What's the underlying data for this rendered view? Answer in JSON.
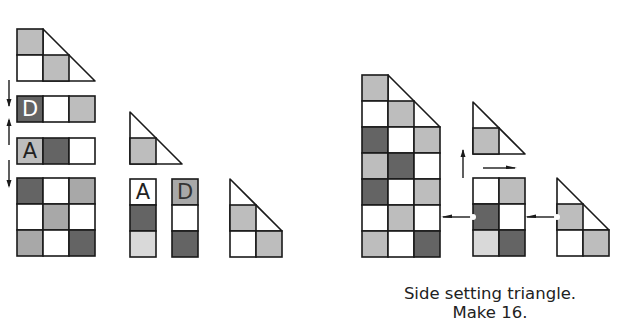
{
  "colors": {
    "W": "#ffffff",
    "L": "#bdbdbd",
    "X": "#d9d9d9",
    "M": "#a8a8a8",
    "D": "#646464",
    "stroke": "#1a1a1a"
  },
  "caption": {
    "line1": "Side setting triangle.",
    "line2": "Make 16."
  },
  "labels": {
    "A": "A",
    "D": "D"
  },
  "units": [
    {
      "name": "left-top-triangle-unit",
      "x": 17,
      "y": 29,
      "cell": 26,
      "rows": [
        "L",
        "WLW"
      ],
      "tri": [
        [
          0,
          1
        ],
        [
          0,
          2
        ]
      ],
      "triFill": "W"
    },
    {
      "name": "left-row-d",
      "x": 17,
      "y": 96,
      "cell": 26,
      "rows": [
        "DWL"
      ],
      "label": {
        "text": "D",
        "cell": 0,
        "color": "#ffffff"
      }
    },
    {
      "name": "left-row-a",
      "x": 17,
      "y": 138,
      "cell": 26,
      "rows": [
        "LDW"
      ],
      "label": {
        "text": "A",
        "cell": 0,
        "color": "#222222"
      }
    },
    {
      "name": "left-nine-patch",
      "x": 17,
      "y": 178,
      "cell": 26,
      "rows": [
        "DWM",
        "WMW",
        "MWD"
      ]
    },
    {
      "name": "mid-small-triangle",
      "x": 130,
      "y": 112,
      "cell": 26,
      "rows": [
        "",
        "L"
      ],
      "tri2": true
    },
    {
      "name": "mid-col-a",
      "x": 130,
      "y": 179,
      "cell": 26,
      "cols": [
        "W",
        "D",
        "X"
      ],
      "label": {
        "text": "A",
        "cell": 0,
        "color": "#222222"
      }
    },
    {
      "name": "mid-col-d",
      "x": 172,
      "y": 179,
      "cell": 26,
      "cols": [
        "M",
        "W",
        "D"
      ],
      "label": {
        "text": "D",
        "cell": 0,
        "color": "#333333"
      }
    },
    {
      "name": "mid-result-triangle",
      "x": 230,
      "y": 179,
      "cell": 26,
      "rows": [
        "",
        "LW",
        "WL"
      ],
      "tri3": true
    },
    {
      "name": "right-big-triangle",
      "x": 362,
      "y": 75,
      "cell": 26,
      "big": [
        "L",
        "WL",
        "DWL",
        "LDW",
        "DWL",
        "WLW",
        "LWD"
      ]
    },
    {
      "name": "right-small-triangle",
      "x": 473,
      "y": 102,
      "cell": 26,
      "rows": [
        "",
        "L"
      ],
      "tri2": true
    },
    {
      "name": "right-six-patch",
      "x": 473,
      "y": 178,
      "cell": 26,
      "rows": [
        "WL",
        "DW",
        "XD"
      ]
    },
    {
      "name": "right-side-triangle",
      "x": 557,
      "y": 178,
      "cell": 26,
      "rows": [
        "",
        "LW",
        "WL"
      ],
      "tri3": true
    }
  ]
}
